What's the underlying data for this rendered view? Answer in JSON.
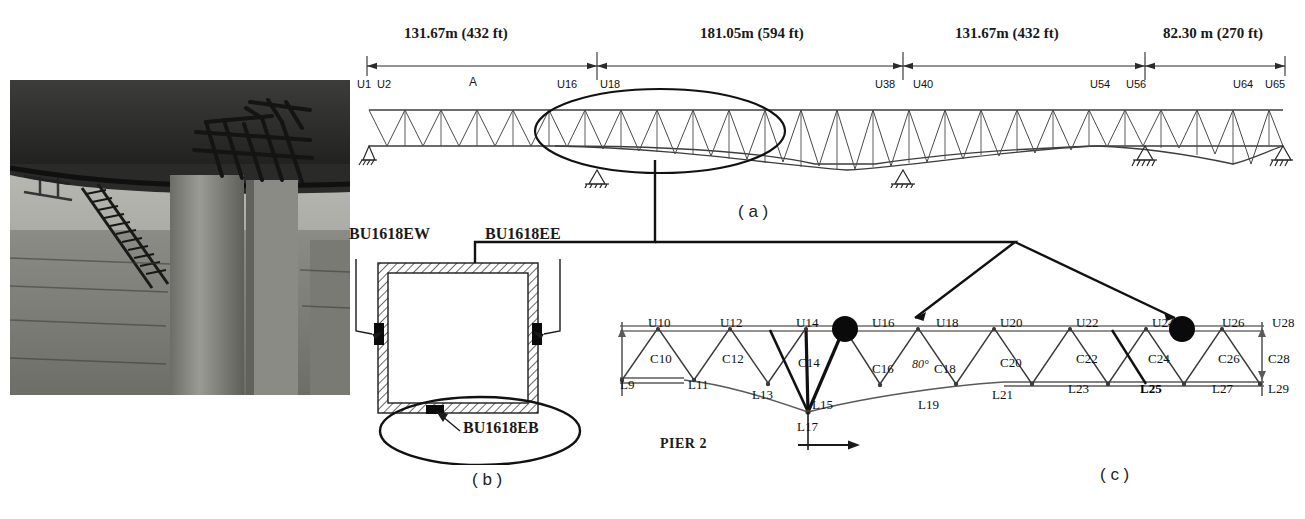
{
  "figure": {
    "panels": [
      {
        "id": "a",
        "label": "( a )"
      },
      {
        "id": "b",
        "label": "( b )"
      },
      {
        "id": "c",
        "label": "( c )"
      }
    ]
  },
  "photo": {
    "caption": "Photograph of steel truss bridge underside with diagonal bracing and stairway"
  },
  "elevation": {
    "spans": [
      {
        "label": "131.67m (432 ft)",
        "metric": "131.67",
        "imperial": "432"
      },
      {
        "label": "181.05m (594 ft)",
        "metric": "181.05",
        "imperial": "594"
      },
      {
        "label": "131.67m (432 ft)",
        "metric": "131.67",
        "imperial": "432"
      },
      {
        "label": "82.30 m (270 ft)",
        "metric": "82.30",
        "imperial": "270"
      }
    ],
    "nodes": [
      {
        "name": "U1"
      },
      {
        "name": "U2"
      },
      {
        "name": "A"
      },
      {
        "name": "U16"
      },
      {
        "name": "U18"
      },
      {
        "name": "U38"
      },
      {
        "name": "U40"
      },
      {
        "name": "U54"
      },
      {
        "name": "U56"
      },
      {
        "name": "U64"
      },
      {
        "name": "U65"
      }
    ]
  },
  "section": {
    "gauges": [
      {
        "name": "BU1618EW",
        "position": "west-face"
      },
      {
        "name": "BU1618EE",
        "position": "east-face"
      },
      {
        "name": "BU1618EB",
        "position": "bottom-face"
      }
    ]
  },
  "detail": {
    "top_nodes": [
      "U10",
      "U12",
      "U14",
      "U16",
      "U18",
      "U20",
      "U22",
      "U24",
      "U26",
      "U28"
    ],
    "bottom_nodes": [
      "L9",
      "L11",
      "L13",
      "L15",
      "L17",
      "L19",
      "L21",
      "L23",
      "L25",
      "L27",
      "L29"
    ],
    "diagonals": [
      "C10",
      "C12",
      "C14",
      "C16",
      "C18",
      "C20",
      "C22",
      "C24",
      "C26",
      "C28"
    ],
    "angle": "80°",
    "pier_label": "PIER 2",
    "marked_nodes": [
      "U17-U18",
      "U26-U28"
    ]
  },
  "colors": {
    "line": "#2b2b2b",
    "text": "#1a1a1a",
    "marker": "#000000",
    "chord": "#4a4a4a"
  }
}
